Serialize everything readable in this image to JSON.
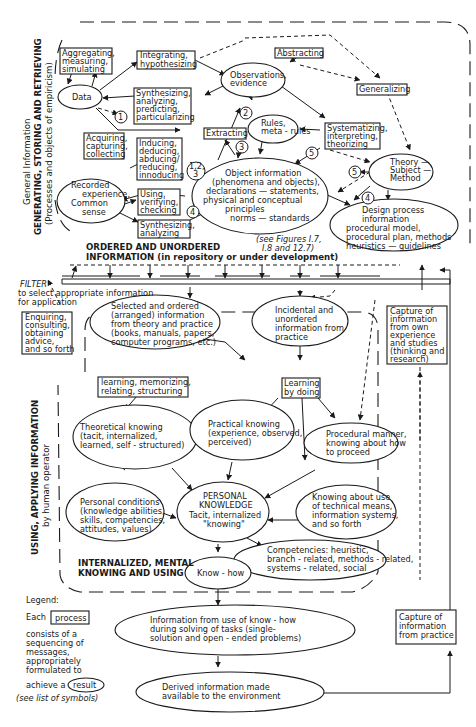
{
  "sections": {
    "top_side_label": [
      "General Information",
      "GENERATING, STORING AND RETRIEVING",
      "(Processes and objects of empiricism)"
    ],
    "bottom_side_label": [
      "USING, APPLYING INFORMATION",
      "by human operator"
    ],
    "ordered_title": [
      "ORDERED AND UNORDERED",
      "INFORMATION (in repository or under development)"
    ],
    "filter_label": [
      "FILTER",
      "to select appropriate information",
      "for application"
    ],
    "internalized_label": [
      "INTERNALIZED, MENTAL",
      "KNOWING AND USING"
    ],
    "see_figures": [
      "(see Figures I.7,",
      "I.8 and 12.7)"
    ]
  },
  "processes": {
    "aggregating": [
      "Aggregating,",
      "measuring,",
      "simulating"
    ],
    "integrating": [
      "Integrating,",
      "hypothesizing"
    ],
    "abstracting": [
      "Abstracting"
    ],
    "generalizing": [
      "Generalizing"
    ],
    "synthesizing_top": [
      "Synthesizing,",
      "analyzing,",
      "predicting,",
      "particularizing"
    ],
    "extracting": [
      "Extracting"
    ],
    "systematizing": [
      "Systematizing,",
      "interpreting,",
      "theorizing"
    ],
    "acquiring": [
      "Acquiring,",
      "capturing,",
      "collecting"
    ],
    "inducing": [
      "Inducing,",
      "deducing,",
      "abducing/",
      "reducing,",
      "innoducing"
    ],
    "using": [
      "Using,",
      "verifying,",
      "checking"
    ],
    "synthesizing_bottom": [
      "Synthesizing,",
      "analyzing"
    ],
    "enquiring": [
      "Enquiring,",
      "consulting,",
      "obtaining",
      "advice,",
      "and so forth"
    ],
    "capture_own": [
      "Capture of",
      "information",
      "from own",
      "experience",
      "and studies",
      "(thinking and",
      "research)"
    ],
    "learning_memorizing": [
      "learning, memorizing,",
      "relating, structuring"
    ],
    "learning_by_doing": [
      "Learning",
      "by doing"
    ],
    "capture_practice": [
      "Capture of",
      "information",
      "from practice"
    ]
  },
  "results": {
    "data": [
      "Data"
    ],
    "observations": [
      "Observations,",
      "evidence"
    ],
    "rules": [
      "Rules,",
      "meta - rules"
    ],
    "theory": [
      "Theory —",
      "Subject —",
      "Method"
    ],
    "recorded": [
      "Recorded",
      "experience,",
      "Common",
      "sense"
    ],
    "object_info": [
      "Object information",
      "(phenomena and objects),",
      "declarations — statements,",
      "physical and conceptual",
      "principles",
      "norms — standards"
    ],
    "design_process": [
      "Design process",
      "information",
      "procedural model,",
      "procedural plan, methods",
      "heuristics — guidelines"
    ],
    "selected_ordered": [
      "Selected and ordered",
      "(arranged) information",
      "from theory and practice",
      "(books, manuals, papers,",
      "computer programs, etc.)"
    ],
    "incidental": [
      "Incidental and",
      "unordered",
      "information from",
      "practice"
    ],
    "theoretical": [
      "Theoretical knowing",
      "(tacit, internalized,",
      "learned, self - structured)"
    ],
    "practical": [
      "Practical knowing",
      "(experience, observed,",
      "perceived)"
    ],
    "procedural": [
      "Procedural manner,",
      "knowing about how",
      "to proceed"
    ],
    "personal_conditions": [
      "Personal conditions",
      "(knowledge abilities,",
      "skills, competencies,",
      "attitudes, values)"
    ],
    "personal_knowledge": [
      "PERSONAL",
      "KNOWLEDGE",
      "Tacit, internalized",
      "\"knowing\""
    ],
    "technical_means": [
      "Knowing about use",
      "of technical means,",
      "information systems,",
      "and so forth"
    ],
    "competencies": [
      "Competencies: heuristic,",
      "branch - related, methods - related,",
      "systems - related, social"
    ],
    "know_how": [
      "Know - how"
    ],
    "info_from_use": [
      "Information from use of know - how",
      "during solving of tasks (single-",
      "solution and open - ended problems)"
    ],
    "derived": [
      "Derived information made",
      "available to the environment"
    ]
  },
  "markers": {
    "m1": "1",
    "m2": "2",
    "m3": "3",
    "m4": "4",
    "m5": "5",
    "m123": [
      "1,2,",
      "3"
    ]
  },
  "legend": {
    "title": "Legend:",
    "each": "Each",
    "process_word": "process",
    "consists": [
      "consists of a",
      "sequencing of",
      "messages,",
      "appropriately",
      "formulated to"
    ],
    "achieve": "achieve a",
    "result_word": "result",
    "see_symbols": "(see list of symbols)"
  }
}
